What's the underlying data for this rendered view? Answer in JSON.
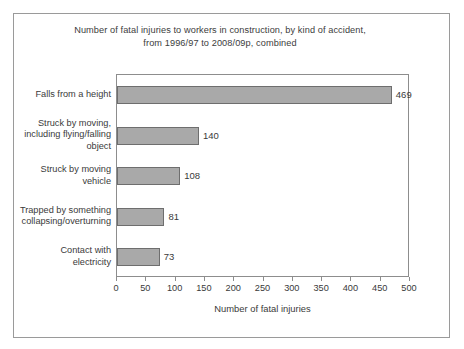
{
  "figure": {
    "background_color": "#ffffff",
    "frame_color": "#9a9a9a"
  },
  "chart_data": {
    "type": "bar",
    "orientation": "horizontal",
    "title": "Number of fatal injuries to workers in construction, by kind of accident, from 1996/97 to 2008/09p, combined",
    "title_lines": [
      "Number of fatal injuries to workers in construction, by kind of accident,",
      "from 1996/97 to 2008/09p, combined"
    ],
    "categories": [
      "Falls from a height",
      "Struck by moving, including flying/falling object",
      "Struck by moving vehicle",
      "Trapped by something collapsing/overturning",
      "Contact with electricity"
    ],
    "category_lines": [
      [
        "Falls from a height"
      ],
      [
        "Struck by moving,",
        "including flying/falling",
        "object"
      ],
      [
        "Struck by moving",
        "vehicle"
      ],
      [
        "Trapped by something",
        "collapsing/overturning"
      ],
      [
        "Contact with",
        "electricity"
      ]
    ],
    "values": [
      469,
      140,
      108,
      81,
      73
    ],
    "value_labels": [
      "469",
      "140",
      "108",
      "81",
      "73"
    ],
    "xlabel": "Number of fatal injuries",
    "ylabel": "",
    "xlim": [
      0,
      500
    ],
    "xticks": [
      0,
      50,
      100,
      150,
      200,
      250,
      300,
      350,
      400,
      450,
      500
    ],
    "xtick_labels": [
      "0",
      "50",
      "100",
      "150",
      "200",
      "250",
      "300",
      "350",
      "400",
      "450",
      "500"
    ],
    "grid": false,
    "legend": null,
    "bar_color": "#a9a9a9",
    "bar_edge_color": "#6e6e6e"
  }
}
